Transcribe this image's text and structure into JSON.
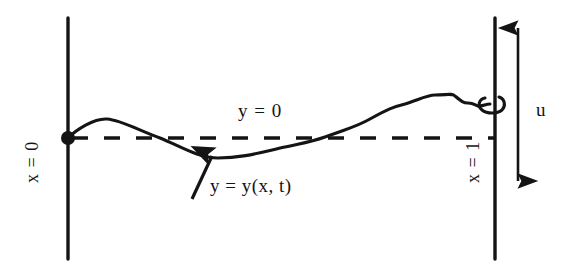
{
  "figure": {
    "colors": {
      "ink": "#141414",
      "background": "#ffffff"
    },
    "labels": {
      "equilibrium": "y = 0",
      "wave_function": "y = y(x, t)",
      "displacement": "u",
      "left_boundary": "x = 0",
      "right_boundary": "x = 1"
    },
    "geometry": {
      "left_boundary_x": 68,
      "right_boundary_x": 495,
      "boundary_top_y": 18,
      "boundary_bottom_y": 259,
      "equilibrium_y": 138,
      "dash_start_x": 72,
      "dash_end_x": 494,
      "pivot_dot": {
        "x": 68,
        "y": 138,
        "r": 7
      },
      "end_ring": {
        "x": 495,
        "y": 103,
        "rx": 11,
        "ry": 8
      },
      "arrow_x": 518,
      "arrow_top_y": 28,
      "arrow_bottom_y": 181,
      "pointer_from": {
        "x": 192,
        "y": 199
      },
      "pointer_to": {
        "x": 212,
        "y": 156
      }
    },
    "curve_points": [
      {
        "x": 68,
        "y": 138
      },
      {
        "x": 85,
        "y": 126
      },
      {
        "x": 107,
        "y": 119
      },
      {
        "x": 130,
        "y": 124
      },
      {
        "x": 160,
        "y": 138
      },
      {
        "x": 190,
        "y": 152
      },
      {
        "x": 218,
        "y": 158
      },
      {
        "x": 250,
        "y": 155
      },
      {
        "x": 285,
        "y": 147
      },
      {
        "x": 325,
        "y": 137
      },
      {
        "x": 370,
        "y": 119
      },
      {
        "x": 405,
        "y": 104
      },
      {
        "x": 435,
        "y": 95
      },
      {
        "x": 455,
        "y": 96
      },
      {
        "x": 468,
        "y": 103
      },
      {
        "x": 480,
        "y": 106
      },
      {
        "x": 490,
        "y": 104
      }
    ]
  }
}
